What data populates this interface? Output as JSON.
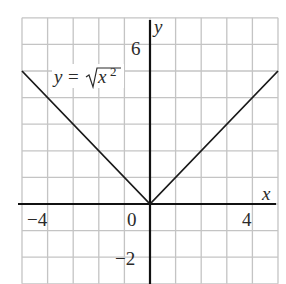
{
  "chart_data": {
    "type": "line",
    "title": "",
    "xlabel": "x",
    "ylabel": "y",
    "xlim": [
      -5,
      5
    ],
    "ylim": [
      -3,
      7
    ],
    "grid": true,
    "x_tick_labels": [
      "-4",
      "0",
      "4"
    ],
    "y_tick_labels": [
      "6",
      "-2"
    ],
    "series": [
      {
        "name": "y = √x²",
        "x": [
          -5,
          0,
          5
        ],
        "y": [
          5,
          0,
          5
        ]
      }
    ],
    "annotations": [
      {
        "text": "y = √x²",
        "x": -2.5,
        "y": 5.2
      }
    ],
    "legend": "none"
  },
  "labels": {
    "x_axis": "x",
    "y_axis": "y",
    "tick_neg4": "−4",
    "tick_0": "0",
    "tick_4": "4",
    "tick_6": "6",
    "tick_neg2": "−2",
    "eq_y": "y",
    "eq_eq": "=",
    "eq_x": "x",
    "eq_exp": "2"
  },
  "colors": {
    "grid": "#c4c4c4",
    "axis": "#111111",
    "curve": "#1a1a1a",
    "text": "#2a2a2a"
  }
}
